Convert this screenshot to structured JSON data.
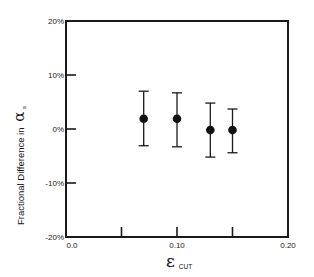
{
  "chart_data": {
    "type": "scatter",
    "title": "",
    "xlabel": "ε",
    "xlabel_subscript": "CUT",
    "ylabel": "Fractional Difference in",
    "ylabel_symbol": "α",
    "ylabel_subscript": "s",
    "xlim": [
      0.0,
      0.2
    ],
    "ylim": [
      -20,
      20
    ],
    "x_ticks": [
      0.0,
      0.05,
      0.1,
      0.15,
      0.2
    ],
    "x_tick_labels": [
      "0.0",
      "",
      "0.10",
      "",
      "0.20"
    ],
    "y_ticks": [
      -20,
      -10,
      0,
      10,
      20
    ],
    "y_tick_labels": [
      "-20%",
      "-10%",
      "0%",
      "10%",
      "20%"
    ],
    "grid": false,
    "legend": "none",
    "series": [
      {
        "name": "data",
        "x": [
          0.07,
          0.1,
          0.13,
          0.15
        ],
        "y": [
          1.9,
          1.9,
          -0.2,
          -0.2
        ],
        "err_high": [
          7.0,
          6.7,
          4.8,
          3.7
        ],
        "err_low": [
          -3.1,
          -3.3,
          -5.2,
          -4.4
        ]
      }
    ]
  }
}
